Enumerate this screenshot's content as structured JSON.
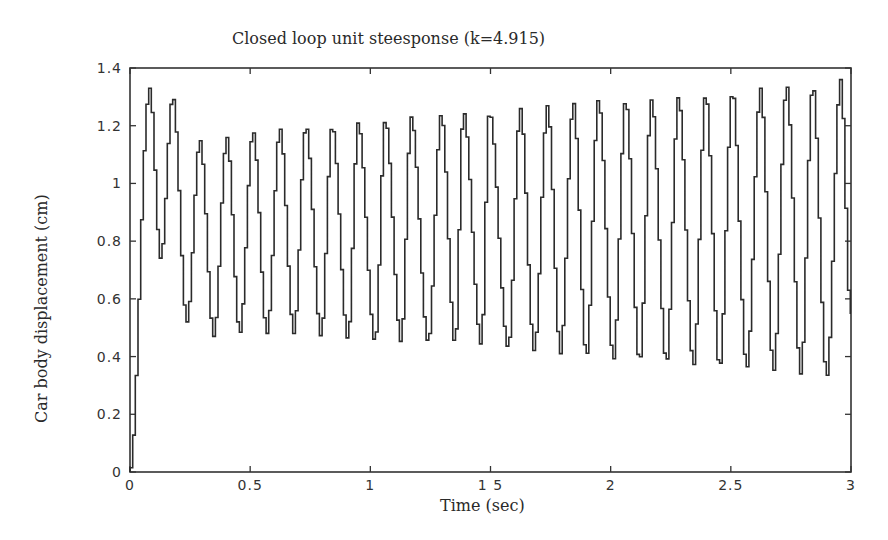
{
  "chart_data": {
    "type": "line",
    "title": "Closed loop unit steesponse (k=4.915)",
    "xlabel": "Time (sec)",
    "ylabel": "Car body displacement (cm)",
    "xlim": [
      0,
      3
    ],
    "ylim": [
      0,
      1.4
    ],
    "xticks": [
      0,
      0.5,
      1,
      1.5,
      2,
      2.5,
      3
    ],
    "xtick_labels": [
      "0",
      "0.5",
      "1",
      "1 5",
      "2",
      "2.5",
      "3"
    ],
    "yticks": [
      0,
      0.2,
      0.4,
      0.6,
      0.8,
      1,
      1.2,
      1.4
    ],
    "ytick_labels": [
      "0",
      "0.2",
      "0.4",
      "0.6",
      "0.8",
      "1",
      "1.2",
      "1.4"
    ],
    "grid": false,
    "legend": null,
    "style": "staircase (zero-order hold), sample time ~0.011 s",
    "series": [
      {
        "name": "car body displacement",
        "color": "#2b2b2b",
        "start": {
          "t": 0.0,
          "v": 0.0
        },
        "peaks": [
          {
            "t": 0.083,
            "v": 1.33
          },
          {
            "t": 0.179,
            "v": 1.3
          },
          {
            "t": 0.292,
            "v": 1.15
          },
          {
            "t": 0.404,
            "v": 1.16
          },
          {
            "t": 0.513,
            "v": 1.18
          },
          {
            "t": 0.625,
            "v": 1.19
          },
          {
            "t": 0.733,
            "v": 1.2
          },
          {
            "t": 0.842,
            "v": 1.2
          },
          {
            "t": 0.95,
            "v": 1.21
          },
          {
            "t": 1.063,
            "v": 1.22
          },
          {
            "t": 1.171,
            "v": 1.23
          },
          {
            "t": 1.296,
            "v": 1.24
          },
          {
            "t": 1.388,
            "v": 1.25
          },
          {
            "t": 1.496,
            "v": 1.25
          },
          {
            "t": 1.625,
            "v": 1.26
          },
          {
            "t": 1.738,
            "v": 1.27
          },
          {
            "t": 1.846,
            "v": 1.28
          },
          {
            "t": 1.95,
            "v": 1.29
          },
          {
            "t": 2.063,
            "v": 1.29
          },
          {
            "t": 2.171,
            "v": 1.29
          },
          {
            "t": 2.283,
            "v": 1.3
          },
          {
            "t": 2.396,
            "v": 1.31
          },
          {
            "t": 2.508,
            "v": 1.32
          },
          {
            "t": 2.625,
            "v": 1.33
          },
          {
            "t": 2.733,
            "v": 1.34
          },
          {
            "t": 2.842,
            "v": 1.34
          },
          {
            "t": 2.958,
            "v": 1.36
          }
        ],
        "troughs": [
          {
            "t": 0.129,
            "v": 0.74
          },
          {
            "t": 0.238,
            "v": 0.52
          },
          {
            "t": 0.35,
            "v": 0.47
          },
          {
            "t": 0.458,
            "v": 0.48
          },
          {
            "t": 0.571,
            "v": 0.48
          },
          {
            "t": 0.683,
            "v": 0.48
          },
          {
            "t": 0.796,
            "v": 0.47
          },
          {
            "t": 0.908,
            "v": 0.46
          },
          {
            "t": 1.021,
            "v": 0.45
          },
          {
            "t": 1.129,
            "v": 0.45
          },
          {
            "t": 1.242,
            "v": 0.45
          },
          {
            "t": 1.354,
            "v": 0.44
          },
          {
            "t": 1.463,
            "v": 0.44
          },
          {
            "t": 1.575,
            "v": 0.43
          },
          {
            "t": 1.683,
            "v": 0.42
          },
          {
            "t": 1.792,
            "v": 0.41
          },
          {
            "t": 1.9,
            "v": 0.4
          },
          {
            "t": 2.013,
            "v": 0.39
          },
          {
            "t": 2.121,
            "v": 0.38
          },
          {
            "t": 2.233,
            "v": 0.38
          },
          {
            "t": 2.346,
            "v": 0.37
          },
          {
            "t": 2.454,
            "v": 0.36
          },
          {
            "t": 2.567,
            "v": 0.36
          },
          {
            "t": 2.679,
            "v": 0.35
          },
          {
            "t": 2.792,
            "v": 0.34
          },
          {
            "t": 2.9,
            "v": 0.33
          }
        ],
        "end": {
          "t": 3.0,
          "v": 0.55
        }
      }
    ]
  }
}
